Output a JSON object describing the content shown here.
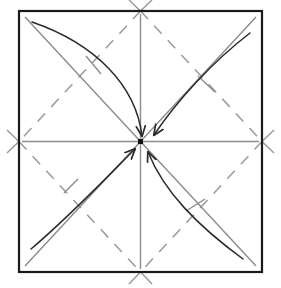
{
  "figure": {
    "kind": "origami-crease-pattern",
    "canvas": {
      "width": 281,
      "height": 288
    },
    "background_color": "#ffffff"
  },
  "colors": {
    "border": "#1a1a1a",
    "crease_solid": "#8c8c8c",
    "crease_dashed": "#9a9a9a",
    "arrow": "#2b2b2b",
    "center_dot": "#111111",
    "tick": "#8c8c8c",
    "background": "#ffffff"
  },
  "paper": {
    "name": "square-sheet",
    "left": 19,
    "top": 11,
    "right": 262,
    "bottom": 272,
    "stroke_width": 2.2
  },
  "geometry": {
    "center": {
      "x": 140.5,
      "y": 141.5
    },
    "corners": {
      "top_left": {
        "x": 19,
        "y": 11
      },
      "top_right": {
        "x": 262,
        "y": 11
      },
      "bottom_right": {
        "x": 262,
        "y": 272
      },
      "bottom_left": {
        "x": 19,
        "y": 272
      }
    },
    "edge_midpoints": {
      "top": {
        "x": 140.5,
        "y": 11
      },
      "right": {
        "x": 262,
        "y": 141.5
      },
      "bottom": {
        "x": 140.5,
        "y": 272
      },
      "left": {
        "x": 19,
        "y": 141.5
      }
    }
  },
  "creases": {
    "solid_lines": [
      {
        "name": "diagonal-tl-br",
        "x1": 25,
        "y1": 17,
        "x2": 256,
        "y2": 266,
        "style": "solid"
      },
      {
        "name": "diagonal-tr-bl",
        "x1": 256,
        "y1": 17,
        "x2": 25,
        "y2": 266,
        "style": "solid"
      },
      {
        "name": "midline-horizontal",
        "x1": 22,
        "y1": 141.5,
        "x2": 259,
        "y2": 141.5,
        "style": "solid"
      },
      {
        "name": "midline-vertical",
        "x1": 140.5,
        "y1": 14,
        "x2": 140.5,
        "y2": 269,
        "style": "solid"
      }
    ],
    "dashed_lines": [
      {
        "name": "diamond-top-left",
        "x1": 140.5,
        "y1": 11,
        "x2": 19,
        "y2": 141.5
      },
      {
        "name": "diamond-top-right",
        "x1": 140.5,
        "y1": 11,
        "x2": 262,
        "y2": 141.5
      },
      {
        "name": "diamond-bottom-right",
        "x1": 262,
        "y1": 141.5,
        "x2": 140.5,
        "y2": 272
      },
      {
        "name": "diamond-bottom-left",
        "x1": 19,
        "y1": 141.5,
        "x2": 140.5,
        "y2": 272
      }
    ],
    "dash_pattern": "11 9",
    "dash_width": 1.5
  },
  "arrows": [
    {
      "name": "fold-arrow-top-left",
      "from_corner": "top_left",
      "to": "center",
      "path": "M 32 22 C 96 44 136 86 142 136",
      "head_angle_deg": 72,
      "head": {
        "x": 142.5,
        "y": 137.5
      },
      "tick": {
        "x1": 86,
        "y1": 56,
        "x2": 101,
        "y2": 74
      }
    },
    {
      "name": "fold-arrow-top-right",
      "from_corner": "top_right",
      "to": "center",
      "path": "M 250 33 C 212 62 176 102 154 135",
      "head_angle_deg": 213,
      "head": {
        "x": 152,
        "y": 137.5
      },
      "tick": {
        "x1": 198,
        "y1": 76,
        "x2": 215,
        "y2": 92
      }
    },
    {
      "name": "fold-arrow-bottom-right",
      "from_corner": "bottom_right",
      "to": "center",
      "path": "M 243 259 C 198 226 164 192 148 152",
      "head_angle_deg": 290,
      "head": {
        "x": 146.5,
        "y": 149
      },
      "tick": {
        "x1": 186,
        "y1": 211,
        "x2": 205,
        "y2": 199
      }
    },
    {
      "name": "fold-arrow-bottom-left",
      "from_corner": "bottom_left",
      "to": "center",
      "path": "M 31 249 C 70 216 106 178 135 149",
      "head_angle_deg": 315,
      "head": {
        "x": 137.5,
        "y": 146.5
      },
      "tick": {
        "x1": 64,
        "y1": 193,
        "x2": 78,
        "y2": 179
      }
    }
  ],
  "edge_marks": {
    "note": "short dashed stubs extending past the sheet at each edge midpoint and corner",
    "items": [
      {
        "name": "mark-left-upper",
        "x1": 19,
        "y1": 141.5,
        "x2": 7,
        "y2": 130
      },
      {
        "name": "mark-left-lower",
        "x1": 19,
        "y1": 141.5,
        "x2": 7,
        "y2": 153
      },
      {
        "name": "mark-right-upper",
        "x1": 262,
        "y1": 141.5,
        "x2": 274,
        "y2": 130
      },
      {
        "name": "mark-right-lower",
        "x1": 262,
        "y1": 141.5,
        "x2": 274,
        "y2": 153
      },
      {
        "name": "mark-top-left",
        "x1": 140.5,
        "y1": 11,
        "x2": 129,
        "y2": 0
      },
      {
        "name": "mark-top-right",
        "x1": 140.5,
        "y1": 11,
        "x2": 152,
        "y2": 0
      },
      {
        "name": "mark-bottom-left",
        "x1": 140.5,
        "y1": 272,
        "x2": 129,
        "y2": 284
      },
      {
        "name": "mark-bottom-right",
        "x1": 140.5,
        "y1": 272,
        "x2": 152,
        "y2": 284
      }
    ]
  },
  "center_marker": {
    "name": "center-point",
    "x": 140.5,
    "y": 141.5,
    "size": 5
  },
  "labels": {
    "figure_caption": "",
    "alt_text": "Square origami paper with diagonal and midline creases; four curved arrows fold each corner to the center point."
  }
}
